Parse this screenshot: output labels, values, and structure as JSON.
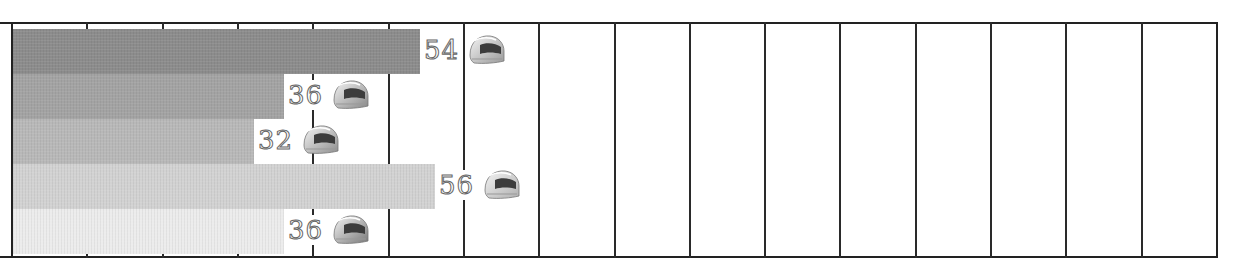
{
  "chart_data": {
    "type": "bar",
    "orientation": "horizontal",
    "title": "",
    "xlabel": "",
    "ylabel": "",
    "categories": [
      "Item 1",
      "Item 2",
      "Item 3",
      "Item 4",
      "Item 5"
    ],
    "values": [
      54,
      36,
      32,
      56,
      36
    ],
    "labels": [
      "54",
      "36",
      "32",
      "56",
      "36"
    ],
    "bar_colors": [
      "#8c8c8c",
      "#a3a3a3",
      "#b8b8b8",
      "#d2d2d2",
      "#ececec"
    ],
    "marker_icon": "racing-helmet-icon",
    "xlim": [
      0,
      160
    ],
    "grid_step": 10,
    "grid": true,
    "tick_labels_visible": false,
    "legend": null
  }
}
